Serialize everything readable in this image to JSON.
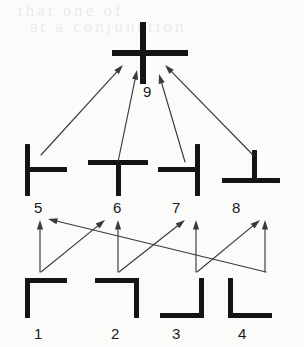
{
  "figure": {
    "background_color": "#fbfbfa",
    "ink_color": "#141414",
    "arrow_color": "#3a3a3a",
    "scan_bleed_line1": "that  one  of",
    "scan_bleed_line2": "at  a  conjunction"
  },
  "levels": [
    {
      "name": "level-1-corners",
      "nodes": [
        {
          "id": "1",
          "label": "1",
          "junction": "corner-top-left",
          "glyph": "┌",
          "x": 25,
          "y": 278,
          "label_x": 34,
          "label_y": 326
        },
        {
          "id": "2",
          "label": "2",
          "junction": "corner-top-right",
          "glyph": "┐",
          "x": 95,
          "y": 278,
          "label_x": 111,
          "label_y": 326
        },
        {
          "id": "3",
          "label": "3",
          "junction": "corner-bottom-right",
          "glyph": "┘",
          "x": 160,
          "y": 278,
          "label_x": 172,
          "label_y": 326
        },
        {
          "id": "4",
          "label": "4",
          "junction": "corner-bottom-left",
          "glyph": "└",
          "x": 228,
          "y": 278,
          "label_x": 238,
          "label_y": 326
        }
      ]
    },
    {
      "name": "level-2-tee-junctions",
      "nodes": [
        {
          "id": "5",
          "label": "5",
          "junction": "tee-right",
          "glyph": "├",
          "x": 25,
          "y": 144,
          "label_x": 34,
          "label_y": 200
        },
        {
          "id": "6",
          "label": "6",
          "junction": "tee-down",
          "glyph": "┬",
          "x": 88,
          "y": 144,
          "label_x": 113,
          "label_y": 200
        },
        {
          "id": "7",
          "label": "7",
          "junction": "tee-left",
          "glyph": "┤",
          "x": 158,
          "y": 144,
          "label_x": 172,
          "label_y": 200
        },
        {
          "id": "8",
          "label": "8",
          "junction": "tee-up",
          "glyph": "┴",
          "x": 222,
          "y": 144,
          "label_x": 232,
          "label_y": 200
        }
      ]
    },
    {
      "name": "level-3-cross",
      "nodes": [
        {
          "id": "9",
          "label": "9",
          "junction": "cross",
          "glyph": "┼",
          "x": 112,
          "y": 22,
          "label_x": 143,
          "label_y": 84
        }
      ]
    }
  ],
  "edges": [
    {
      "id": "e1-5",
      "from": "1",
      "to": "5",
      "kind": "vertical",
      "x1": 40,
      "y1": 272,
      "x2": 40,
      "y2": 220
    },
    {
      "id": "e1-6",
      "from": "1",
      "to": "6",
      "kind": "diagonal",
      "x1": 41,
      "y1": 272,
      "x2": 105,
      "y2": 220
    },
    {
      "id": "e2-6",
      "from": "2",
      "to": "6",
      "kind": "vertical",
      "x1": 118,
      "y1": 272,
      "x2": 118,
      "y2": 220
    },
    {
      "id": "e2-7",
      "from": "2",
      "to": "7",
      "kind": "diagonal",
      "x1": 119,
      "y1": 272,
      "x2": 185,
      "y2": 220
    },
    {
      "id": "e3-7",
      "from": "3",
      "to": "7",
      "kind": "vertical",
      "x1": 196,
      "y1": 272,
      "x2": 196,
      "y2": 220
    },
    {
      "id": "e3-8",
      "from": "3",
      "to": "8",
      "kind": "diagonal",
      "x1": 197,
      "y1": 272,
      "x2": 260,
      "y2": 220
    },
    {
      "id": "e4-8",
      "from": "4",
      "to": "8",
      "kind": "vertical",
      "x1": 265,
      "y1": 272,
      "x2": 265,
      "y2": 220
    },
    {
      "id": "e4-5",
      "from": "4",
      "to": "5",
      "kind": "long-diagonal",
      "x1": 266,
      "y1": 272,
      "x2": 48,
      "y2": 219
    },
    {
      "id": "e5-9",
      "from": "5",
      "to": "9",
      "kind": "diagonal",
      "x1": 41,
      "y1": 155,
      "x2": 123,
      "y2": 65
    },
    {
      "id": "e6-9",
      "from": "6",
      "to": "9",
      "kind": "diagonal",
      "x1": 118,
      "y1": 162,
      "x2": 137,
      "y2": 70
    },
    {
      "id": "e7-9",
      "from": "7",
      "to": "9",
      "kind": "diagonal",
      "x1": 185,
      "y1": 162,
      "x2": 159,
      "y2": 74
    },
    {
      "id": "e8-9",
      "from": "8",
      "to": "9",
      "kind": "diagonal",
      "x1": 253,
      "y1": 155,
      "x2": 165,
      "y2": 65
    }
  ]
}
